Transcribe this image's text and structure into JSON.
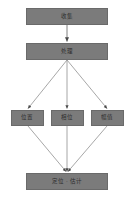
{
  "diagram": {
    "type": "flowchart",
    "background_color": "#ffffff",
    "node_fill_color": "#7b7b7b",
    "node_border_color": "#6a6a6a",
    "edge_color": "#808080",
    "text_color": "#2e2e2e",
    "nodes": [
      {
        "id": "input",
        "label": "收集",
        "level": 0
      },
      {
        "id": "process",
        "label": "处理",
        "level": 1
      },
      {
        "id": "a",
        "label": "位置",
        "level": 2
      },
      {
        "id": "b",
        "label": "相位",
        "level": 2
      },
      {
        "id": "c",
        "label": "幅值",
        "level": 2
      },
      {
        "id": "output",
        "label": "定位 · 估计",
        "level": 3
      }
    ],
    "edges": [
      {
        "from": "input",
        "to": "process",
        "arrow": "single"
      },
      {
        "from": "process",
        "to": "a",
        "arrow": "single"
      },
      {
        "from": "process",
        "to": "b",
        "arrow": "single"
      },
      {
        "from": "process",
        "to": "c",
        "arrow": "single"
      },
      {
        "from": "a",
        "to": "output",
        "arrow": "single"
      },
      {
        "from": "b",
        "to": "output",
        "arrow": "single"
      },
      {
        "from": "c",
        "to": "output",
        "arrow": "single"
      }
    ]
  }
}
